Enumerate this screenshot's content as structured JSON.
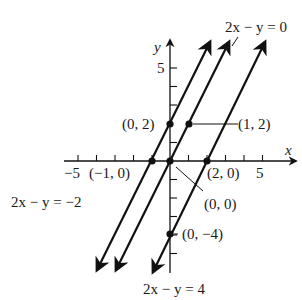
{
  "figure": {
    "axes": {
      "x_label": "x",
      "y_label": "y",
      "x_tick_label_left": "−5",
      "x_tick_label_right": "5",
      "y_tick_label_top": "5"
    },
    "lines": [
      {
        "equation": "2x − y = −2",
        "x_intercept": "(−1, 0)",
        "y_intercept": "(0, 2)"
      },
      {
        "equation": "2x − y = 0",
        "points": [
          "(0, 0)",
          "(1, 2)"
        ]
      },
      {
        "equation": "2x − y = 4",
        "x_intercept": "(2, 0)",
        "y_intercept": "(0, −4)"
      }
    ],
    "point_labels": {
      "p_0_2": "(0, 2)",
      "p_1_2": "(1, 2)",
      "p_m1_0": "(−1, 0)",
      "p_2_0": "(2, 0)",
      "p_0_0": "(0, 0)",
      "p_0_m4": "(0, −4)"
    },
    "equation_labels": {
      "line_minus2": "2x − y = −2",
      "line_0": "2x − y = 0",
      "line_4": "2x − y = 4"
    },
    "colors": {
      "ink": "#111111",
      "background": "#ffffff"
    }
  }
}
